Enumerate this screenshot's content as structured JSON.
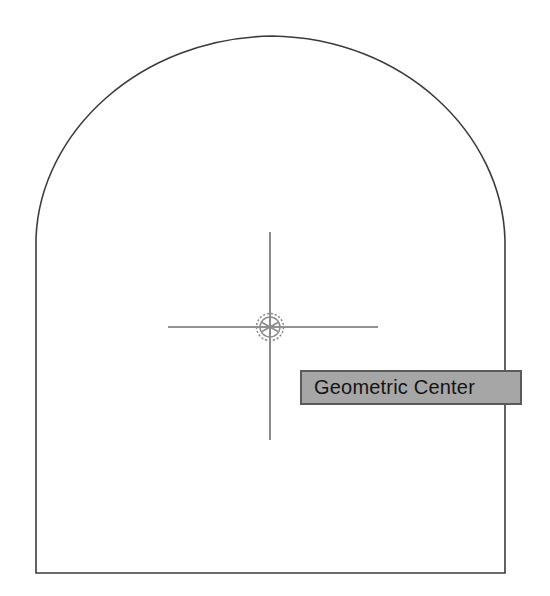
{
  "app": {
    "kind": "cad-viewport",
    "background_color": "#ffffff"
  },
  "tooltip": {
    "label": "Geometric Center",
    "background_color": "#a6a6a6",
    "border_color": "#5a5a5a",
    "text_color": "#141414",
    "x": 300,
    "y": 370,
    "width": 222,
    "height": 35
  },
  "cursor": {
    "name": "crosshair-cursor",
    "center_x": 270,
    "center_y": 327,
    "horizontal_start_x": 168,
    "horizontal_end_x": 378,
    "vertical_start_y": 232,
    "vertical_end_y": 440,
    "line_color": "#6e6e6e",
    "line_width": 1.6
  },
  "snap_marker": {
    "name": "geometric-center-osnap-marker",
    "type": "geometric-center",
    "center_x": 270,
    "center_y": 327,
    "outer_radius": 14,
    "inner_radius": 10,
    "spoke_count": 6,
    "color": "#8c8c8c"
  },
  "shape": {
    "name": "arched-closed-polyline",
    "stroke_color": "#3b3b3b",
    "stroke_width": 1.6,
    "fill": "none",
    "geometry": {
      "left_wall_x": 36,
      "right_wall_x": 505,
      "bottom_y": 573,
      "spring_left_y": 238,
      "spring_right_y": 240,
      "arc_apex_x": 272,
      "arc_apex_y": 36
    },
    "path": "M 36 573 L 36 238 C 40 132 140 38 272 36 C 404 38 502 134 505 240 L 505 573 Z"
  },
  "chart_data": {
    "type": "table",
    "rows": [
      {
        "element": "Profile outline",
        "value": "Arched closed polyline"
      },
      {
        "element": "Active osnap",
        "value": "Geometric Center"
      },
      {
        "element": "Snap point X",
        "value": "270"
      },
      {
        "element": "Snap point Y",
        "value": "327"
      }
    ]
  }
}
